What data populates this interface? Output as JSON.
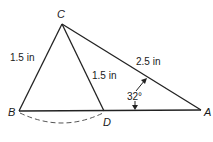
{
  "diagram": {
    "type": "triangle-geometry",
    "points": {
      "C": {
        "label": "C",
        "x": 62,
        "y": 24
      },
      "B": {
        "label": "B",
        "x": 19,
        "y": 111
      },
      "D": {
        "label": "D",
        "x": 104,
        "y": 111
      },
      "A": {
        "label": "A",
        "x": 201,
        "y": 110
      }
    },
    "segments": [
      {
        "from": "C",
        "to": "B",
        "label": "1.5 in"
      },
      {
        "from": "C",
        "to": "D",
        "label": "1.5 in"
      },
      {
        "from": "C",
        "to": "A",
        "label": "2.5 in"
      },
      {
        "from": "B",
        "to": "A",
        "label": ""
      }
    ],
    "angle": {
      "vertex": "A",
      "value": "32°"
    },
    "arc": {
      "from": "B",
      "to": "D",
      "style": "dashed"
    }
  }
}
